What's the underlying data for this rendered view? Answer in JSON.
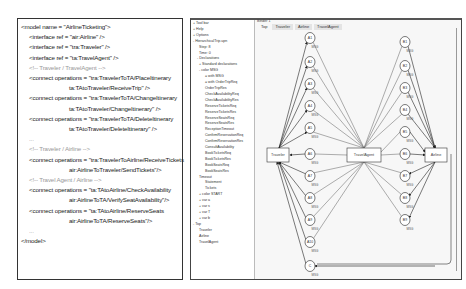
{
  "code": {
    "lines": [
      {
        "text": "<model name = \"AirlineTicketing\">",
        "indent": 0,
        "type": "code"
      },
      {
        "text": "<interface ref = \"air:Airline\" />",
        "indent": 1,
        "type": "code"
      },
      {
        "text": "<interface ref = \"tra:Traveler\" />",
        "indent": 1,
        "type": "code"
      },
      {
        "text": "<interface ref = \"ta:TravelAgent\" />",
        "indent": 1,
        "type": "code"
      },
      {
        "text": "<!-- Traveler / TravelAgent -->",
        "indent": 1,
        "type": "comment"
      },
      {
        "text": "<connect operations = \"tra:TravelerToTA/PlaceItinerary",
        "indent": 1,
        "type": "code"
      },
      {
        "text": "ta:TAtoTraveler/ReceiveTrip\" />",
        "indent": 2,
        "type": "code"
      },
      {
        "text": "<connect operations = \"tra:TravelerToTA/ChangeItinerary",
        "indent": 1,
        "type": "code"
      },
      {
        "text": "ta:TAtoTraveler/ChangeItinerary\" />",
        "indent": 2,
        "type": "code"
      },
      {
        "text": "<connect operations = \"tra:TravelerToTA/DeleteItinerary",
        "indent": 1,
        "type": "code"
      },
      {
        "text": "ta:TAtoTraveler/DeleteItinerary\" />",
        "indent": 2,
        "type": "code"
      },
      {
        "text": "...",
        "indent": 1,
        "type": "comment"
      },
      {
        "text": "<!-- Traveler / Airline -->",
        "indent": 1,
        "type": "comment"
      },
      {
        "text": "<connect operations = \"tra:TravelerToAirline/ReceiveTickets",
        "indent": 1,
        "type": "code"
      },
      {
        "text": "air:AirlineToTraveler/SendTickets\"/>",
        "indent": 2,
        "type": "code"
      },
      {
        "text": "<!-- Travel Agent / Airline -->",
        "indent": 1,
        "type": "comment"
      },
      {
        "text": "<connect operations = \"ta:TAtoAirline/CheckAvailability",
        "indent": 1,
        "type": "code"
      },
      {
        "text": "air:AirlineToTA/VerifySeatAvailability\"/>",
        "indent": 2,
        "type": "code"
      },
      {
        "text": "<connect operations = \"ta:TAtoAirline/ReserveSeats",
        "indent": 1,
        "type": "code"
      },
      {
        "text": "air:AirlineToTA/ReserveSeats\"/>",
        "indent": 2,
        "type": "code"
      },
      {
        "text": "...",
        "indent": 1,
        "type": "comment"
      },
      {
        "text": "</model>",
        "indent": 0,
        "type": "code"
      }
    ]
  },
  "app": {
    "tree": [
      "+ Tool bar",
      "+ Help",
      "+ Options",
      "- HierarchicalTrip.upn",
      "Step: 8",
      "Time: 0",
      "- Declarations",
      "+ Standard declarations",
      "- color MSG",
      "= with MSG",
      "= with OrderTripReq",
      "OrderTripRes",
      "CheckAvailabilityReq",
      "CheckAvailabilityRes",
      "ReserveTicketsReq",
      "ReserveTicketsRes",
      "ReserveSeatsReq",
      "ReserveSeatsRes",
      "ReceptionTimeout",
      "ConfirmReservationReq",
      "ConfirmReservationRes",
      "ConsultAvailability",
      "BookTicketsReq",
      "BookTicketsRes",
      "BookSeatsReq",
      "BookSeatsRes",
      "Timeout",
      "Statement",
      "Tickets",
      "+ color START",
      "+ var a",
      "+ var s",
      "+ var T",
      "+ var b",
      "- Top",
      "Traveler",
      "Airline",
      "TravelAgent"
    ],
    "page_label": "Binder 1",
    "tabs": [
      "Top",
      "Traveler",
      "Airline",
      "TravelAgent"
    ],
    "active_tab": "Top",
    "graph": {
      "substitution_nodes": [
        "Traveler",
        "TravelAgent",
        "Airline"
      ],
      "left_places": [
        "A1",
        "A2",
        "A3",
        "A4",
        "A5",
        "A6",
        "A7",
        "A8",
        "A9",
        "A10",
        "C"
      ],
      "right_places": [
        "B1",
        "B2",
        "B3",
        "B4",
        "B5",
        "B6",
        "B7",
        "B8",
        "B9"
      ],
      "place_type_label": "MSG"
    }
  }
}
